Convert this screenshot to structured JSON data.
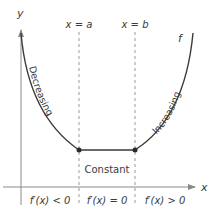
{
  "axes": {
    "x_label": "x",
    "y_label": "y"
  },
  "guides": {
    "left": "x = a",
    "right": "x = b"
  },
  "function_label": "f",
  "regions": {
    "decreasing": "Decreasing",
    "constant": "Constant",
    "increasing": "Increasing"
  },
  "derivative_labels": {
    "left": "f′(x) < 0",
    "middle": "f′(x) = 0",
    "right": "f′(x) > 0"
  },
  "colors": {
    "curve": "#3a3a3a",
    "axis": "#8a8a8a",
    "dash": "#9a9a9a",
    "text": "#3a3a3a"
  }
}
